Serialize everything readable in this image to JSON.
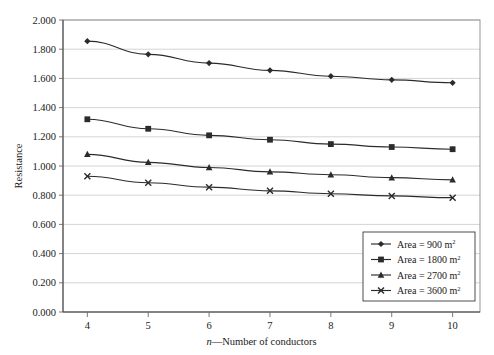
{
  "chart_data": {
    "type": "line",
    "title": "",
    "xlabel": "n—Number of conductors",
    "xlabel_italic_prefix": "n",
    "xlabel_rest": "—Number of conductors",
    "ylabel": "Resistance",
    "x": [
      4,
      5,
      6,
      7,
      8,
      9,
      10
    ],
    "xtick_labels": [
      "4",
      "5",
      "6",
      "7",
      "8",
      "9",
      "10"
    ],
    "xlim": [
      3.6,
      10.45
    ],
    "ylim": [
      0.0,
      2.0
    ],
    "ytick_labels": [
      "0.000",
      "0.200",
      "0.400",
      "0.600",
      "0.800",
      "1.000",
      "1.200",
      "1.400",
      "1.600",
      "1.800",
      "2.000"
    ],
    "ytick_values": [
      0.0,
      0.2,
      0.4,
      0.6,
      0.8,
      1.0,
      1.2,
      1.4,
      1.6,
      1.8,
      2.0
    ],
    "grid": true,
    "grid_axis": "y",
    "legend_position": "lower-right-inside",
    "series": [
      {
        "name": "Area = 900 m²",
        "label_main": "Area = 900 m",
        "label_sup": "2",
        "marker": "diamond",
        "color": "#2b2b2b",
        "values": [
          1.855,
          1.765,
          1.705,
          1.655,
          1.615,
          1.59,
          1.57
        ]
      },
      {
        "name": "Area = 1800 m²",
        "label_main": "Area = 1800 m",
        "label_sup": "2",
        "marker": "square",
        "color": "#2b2b2b",
        "values": [
          1.32,
          1.255,
          1.21,
          1.18,
          1.15,
          1.13,
          1.115
        ]
      },
      {
        "name": "Area = 2700 m²",
        "label_main": "Area = 2700 m",
        "label_sup": "2",
        "marker": "triangle",
        "color": "#2b2b2b",
        "values": [
          1.08,
          1.025,
          0.99,
          0.96,
          0.94,
          0.92,
          0.905
        ]
      },
      {
        "name": "Area = 3600 m²",
        "label_main": "Area = 3600 m",
        "label_sup": "2",
        "marker": "cross",
        "color": "#2b2b2b",
        "values": [
          0.93,
          0.885,
          0.855,
          0.83,
          0.81,
          0.795,
          0.783
        ]
      }
    ]
  }
}
